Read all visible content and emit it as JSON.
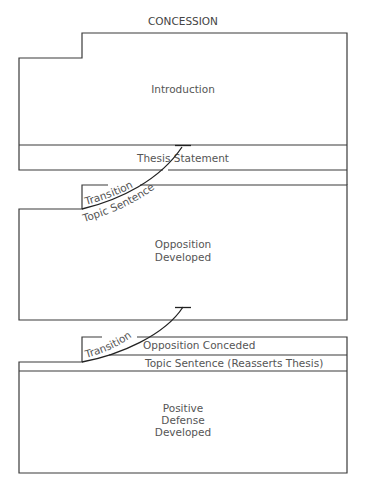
{
  "title": "CONCESSION",
  "sections": {
    "introduction": {
      "label": "Introduction"
    },
    "thesis": {
      "label": "Thesis Statement"
    },
    "opposition": {
      "transition_label": "Transition",
      "topic_label": "Topic Sentence",
      "body_line1": "Opposition",
      "body_line2": "Developed"
    },
    "defense": {
      "transition_label": "Transition",
      "conceded_label": "Opposition Conceded",
      "topic_label": "Topic Sentence (Reasserts Thesis)",
      "body_line1": "Positive",
      "body_line2": "Defense",
      "body_line3": "Developed"
    }
  },
  "colors": {
    "line": "#3a3a3a",
    "text": "#555555",
    "background": "#ffffff"
  }
}
